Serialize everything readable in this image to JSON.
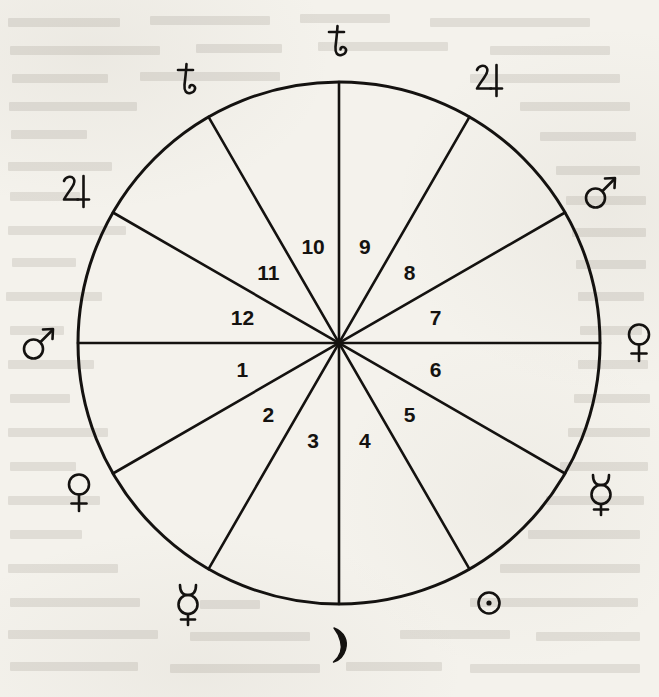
{
  "diagram": {
    "ink_color": "#141210",
    "paper_color": "#f4f2ec",
    "circle": {
      "cx": 339,
      "cy": 343,
      "radius": 261,
      "stroke_width": 3
    },
    "spoke_count": 12,
    "spoke_step_degrees": 30,
    "houses": [
      {
        "number": "1",
        "angle_deg": 195,
        "radius": 100
      },
      {
        "number": "2",
        "angle_deg": 225,
        "radius": 100
      },
      {
        "number": "3",
        "angle_deg": 255,
        "radius": 100
      },
      {
        "number": "4",
        "angle_deg": 285,
        "radius": 100
      },
      {
        "number": "5",
        "angle_deg": 315,
        "radius": 100
      },
      {
        "number": "6",
        "angle_deg": 345,
        "radius": 100
      },
      {
        "number": "7",
        "angle_deg": 15,
        "radius": 100
      },
      {
        "number": "8",
        "angle_deg": 45,
        "radius": 100
      },
      {
        "number": "9",
        "angle_deg": 75,
        "radius": 100
      },
      {
        "number": "10",
        "angle_deg": 105,
        "radius": 100
      },
      {
        "number": "11",
        "angle_deg": 135,
        "radius": 100
      },
      {
        "number": "12",
        "angle_deg": 165,
        "radius": 100
      }
    ],
    "planets": [
      {
        "name": "saturn",
        "symbol": "♄",
        "label": "Saturn",
        "angle_deg": 90,
        "radius": 300
      },
      {
        "name": "jupiter",
        "symbol": "♃",
        "label": "Jupiter",
        "angle_deg": 60,
        "radius": 302
      },
      {
        "name": "mars",
        "symbol": "♂",
        "label": "Mars",
        "angle_deg": 30,
        "radius": 303
      },
      {
        "name": "venus",
        "symbol": "♀",
        "label": "Venus",
        "angle_deg": 0,
        "radius": 300
      },
      {
        "name": "mercury",
        "symbol": "☿",
        "label": "Mercury",
        "angle_deg": 330,
        "radius": 303
      },
      {
        "name": "sun",
        "symbol": "☉",
        "label": "Sun",
        "angle_deg": 300,
        "radius": 300
      },
      {
        "name": "moon",
        "symbol": "☽",
        "label": "Moon",
        "angle_deg": 270,
        "radius": 302
      },
      {
        "name": "mercury",
        "symbol": "☿",
        "label": "Mercury",
        "angle_deg": 240,
        "radius": 303
      },
      {
        "name": "venus",
        "symbol": "♀",
        "label": "Venus",
        "angle_deg": 210,
        "radius": 300
      },
      {
        "name": "mars",
        "symbol": "♂",
        "label": "Mars",
        "angle_deg": 180,
        "radius": 300
      },
      {
        "name": "jupiter",
        "symbol": "♃",
        "label": "Jupiter",
        "angle_deg": 150,
        "radius": 303
      },
      {
        "name": "saturn",
        "symbol": "♄",
        "label": "Saturn",
        "angle_deg": 120,
        "radius": 303
      }
    ],
    "bleed_text_lines": [
      {
        "x": 8,
        "y": 18,
        "w": 112
      },
      {
        "x": 150,
        "y": 16,
        "w": 120
      },
      {
        "x": 300,
        "y": 14,
        "w": 90
      },
      {
        "x": 430,
        "y": 18,
        "w": 160
      },
      {
        "x": 10,
        "y": 46,
        "w": 150
      },
      {
        "x": 196,
        "y": 44,
        "w": 86
      },
      {
        "x": 318,
        "y": 42,
        "w": 130
      },
      {
        "x": 490,
        "y": 46,
        "w": 120
      },
      {
        "x": 12,
        "y": 74,
        "w": 96
      },
      {
        "x": 140,
        "y": 72,
        "w": 140
      },
      {
        "x": 470,
        "y": 74,
        "w": 150
      },
      {
        "x": 9,
        "y": 102,
        "w": 128
      },
      {
        "x": 520,
        "y": 102,
        "w": 110
      },
      {
        "x": 11,
        "y": 130,
        "w": 76
      },
      {
        "x": 540,
        "y": 132,
        "w": 96
      },
      {
        "x": 8,
        "y": 162,
        "w": 104
      },
      {
        "x": 556,
        "y": 166,
        "w": 84
      },
      {
        "x": 10,
        "y": 192,
        "w": 70
      },
      {
        "x": 566,
        "y": 196,
        "w": 80
      },
      {
        "x": 8,
        "y": 226,
        "w": 118
      },
      {
        "x": 572,
        "y": 228,
        "w": 74
      },
      {
        "x": 12,
        "y": 258,
        "w": 64
      },
      {
        "x": 576,
        "y": 260,
        "w": 70
      },
      {
        "x": 6,
        "y": 292,
        "w": 96
      },
      {
        "x": 578,
        "y": 292,
        "w": 66
      },
      {
        "x": 10,
        "y": 326,
        "w": 54
      },
      {
        "x": 580,
        "y": 326,
        "w": 62
      },
      {
        "x": 8,
        "y": 360,
        "w": 86
      },
      {
        "x": 578,
        "y": 360,
        "w": 70
      },
      {
        "x": 10,
        "y": 394,
        "w": 60
      },
      {
        "x": 574,
        "y": 394,
        "w": 76
      },
      {
        "x": 8,
        "y": 428,
        "w": 100
      },
      {
        "x": 568,
        "y": 428,
        "w": 82
      },
      {
        "x": 10,
        "y": 462,
        "w": 66
      },
      {
        "x": 560,
        "y": 462,
        "w": 88
      },
      {
        "x": 8,
        "y": 496,
        "w": 92
      },
      {
        "x": 546,
        "y": 496,
        "w": 98
      },
      {
        "x": 10,
        "y": 530,
        "w": 72
      },
      {
        "x": 528,
        "y": 530,
        "w": 112
      },
      {
        "x": 8,
        "y": 564,
        "w": 110
      },
      {
        "x": 500,
        "y": 564,
        "w": 140
      },
      {
        "x": 10,
        "y": 598,
        "w": 130
      },
      {
        "x": 200,
        "y": 600,
        "w": 60
      },
      {
        "x": 470,
        "y": 598,
        "w": 168
      },
      {
        "x": 8,
        "y": 630,
        "w": 150
      },
      {
        "x": 190,
        "y": 632,
        "w": 120
      },
      {
        "x": 400,
        "y": 630,
        "w": 110
      },
      {
        "x": 536,
        "y": 632,
        "w": 104
      },
      {
        "x": 10,
        "y": 662,
        "w": 128
      },
      {
        "x": 170,
        "y": 664,
        "w": 150
      },
      {
        "x": 346,
        "y": 662,
        "w": 96
      },
      {
        "x": 470,
        "y": 664,
        "w": 170
      }
    ]
  }
}
